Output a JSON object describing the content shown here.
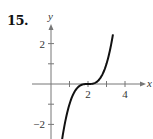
{
  "problem_number": "15.",
  "chart_data": {
    "type": "line",
    "title": "",
    "xlabel": "x",
    "ylabel": "y",
    "function": "y = (x - 2)^3",
    "x_ticks": [
      1,
      2,
      3,
      4
    ],
    "x_tick_labels": [
      "",
      "2",
      "",
      "4"
    ],
    "y_ticks": [
      -2,
      -1,
      1,
      2
    ],
    "y_tick_labels": [
      "-2",
      "",
      "",
      "2"
    ],
    "xlim": [
      -1,
      4.5
    ],
    "ylim": [
      -2.7,
      2.8
    ],
    "grid": false,
    "series": [
      {
        "name": "curve",
        "x": [
          0.6,
          0.8,
          1.0,
          1.2,
          1.4,
          1.6,
          1.8,
          2.0,
          2.2,
          2.4,
          2.6,
          2.8,
          3.0,
          3.2,
          3.35
        ],
        "y": [
          -2.74,
          -1.73,
          -1.0,
          -0.51,
          -0.22,
          -0.06,
          -0.01,
          0.0,
          0.01,
          0.06,
          0.22,
          0.51,
          1.0,
          1.73,
          2.46
        ]
      }
    ],
    "color": "#111111"
  }
}
